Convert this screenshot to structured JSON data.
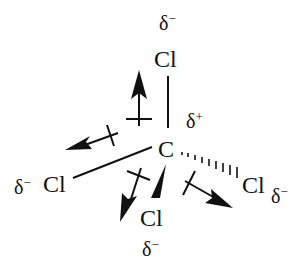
{
  "molecule": "CCl4",
  "colors": {
    "ink": "#111111",
    "background": "#ffffff"
  },
  "atoms": {
    "center": {
      "symbol": "C",
      "charge": "δ",
      "charge_sign": "+"
    },
    "top": {
      "symbol": "Cl",
      "charge": "δ",
      "charge_sign": "−"
    },
    "left": {
      "symbol": "Cl",
      "charge": "δ",
      "charge_sign": "−"
    },
    "front": {
      "symbol": "Cl",
      "charge": "δ",
      "charge_sign": "−"
    },
    "back": {
      "symbol": "Cl",
      "charge": "δ",
      "charge_sign": "−"
    }
  },
  "bonds": [
    {
      "to": "top",
      "style": "plain"
    },
    {
      "to": "left",
      "style": "plain"
    },
    {
      "to": "front",
      "style": "wedge"
    },
    {
      "to": "back",
      "style": "hashed"
    }
  ],
  "dipole_arrows": [
    {
      "direction": "toward-top"
    },
    {
      "direction": "toward-left"
    },
    {
      "direction": "toward-front"
    },
    {
      "direction": "toward-back"
    }
  ]
}
